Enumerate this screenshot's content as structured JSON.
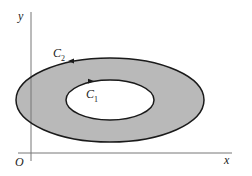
{
  "diagram": {
    "axes": {
      "x_label": "x",
      "y_label": "y",
      "origin_label": "O"
    },
    "curves": [
      {
        "name": "C",
        "subscript": "2",
        "role": "outer-boundary",
        "orientation": "counterclockwise"
      },
      {
        "name": "C",
        "subscript": "1",
        "role": "inner-boundary",
        "orientation": "clockwise"
      }
    ],
    "region": {
      "description": "annular region between C1 and C2",
      "fill_color": "#b9b9b9"
    },
    "colors": {
      "axis": "#777777",
      "curve": "#1a1a1a",
      "inner_fill": "#ffffff"
    }
  }
}
